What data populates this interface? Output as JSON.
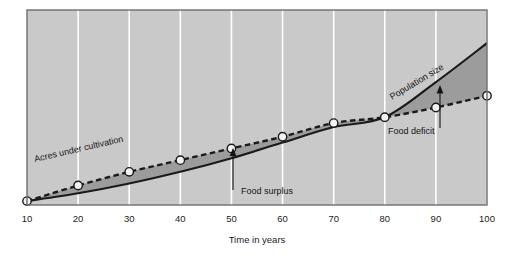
{
  "chart_data": {
    "type": "line",
    "title": "",
    "xlabel": "Time in years",
    "ylabel": "",
    "xlim": [
      10,
      100
    ],
    "ylim": [
      0,
      100
    ],
    "grid": true,
    "legend_position": "inline-labels",
    "x": [
      10,
      20,
      30,
      40,
      50,
      60,
      70,
      80,
      90,
      100
    ],
    "xtick_labels": [
      "10",
      "20",
      "30",
      "40",
      "50",
      "60",
      "70",
      "80",
      "90",
      "100"
    ],
    "series": [
      {
        "name": "Acres under cultivation",
        "style": "dashed",
        "markers": "open-circle",
        "values": [
          2,
          10,
          17,
          23,
          29,
          35,
          42,
          45,
          50,
          56
        ]
      },
      {
        "name": "Population size",
        "style": "solid",
        "markers": "none",
        "values": [
          2,
          6,
          11,
          17,
          24,
          32,
          40,
          45,
          63,
          83
        ]
      }
    ],
    "regions": [
      {
        "name": "Food surplus",
        "between": [
          "Population size",
          "Acres under cultivation"
        ],
        "from_x": 10,
        "to_x": 80
      },
      {
        "name": "Food deficit",
        "between": [
          "Acres under cultivation",
          "Population size"
        ],
        "from_x": 80,
        "to_x": 100
      }
    ],
    "annotations": [
      {
        "text": "Acres under cultivation",
        "type": "series-label",
        "rotation": -13
      },
      {
        "text": "Population size",
        "type": "series-label",
        "rotation": -31
      },
      {
        "text": "Food surplus",
        "type": "callout",
        "arrow": "up",
        "at_x": 53
      },
      {
        "text": "Food deficit",
        "type": "callout",
        "arrow": "up",
        "at_x": 94
      }
    ],
    "colors": {
      "plot_background": "#c9c9c9",
      "gridline": "#ffffff",
      "surplus_fill": "#9c9c9c",
      "deficit_fill": "#9c9c9c",
      "solid_line": "#1a1a1a",
      "dashed_line": "#1a1a1a",
      "marker_fill": "#f2f2f2",
      "marker_stroke": "#1a1a1a",
      "border": "#6e6e6e",
      "text": "#141414",
      "page_background": "#ffffff"
    }
  },
  "axis": {
    "x_title": "Time in years",
    "ticks": [
      "10",
      "20",
      "30",
      "40",
      "50",
      "60",
      "70",
      "80",
      "90",
      "100"
    ]
  },
  "labels": {
    "acres": "Acres under cultivation",
    "population": "Population size",
    "food_surplus": "Food surplus",
    "food_deficit": "Food deficit"
  }
}
